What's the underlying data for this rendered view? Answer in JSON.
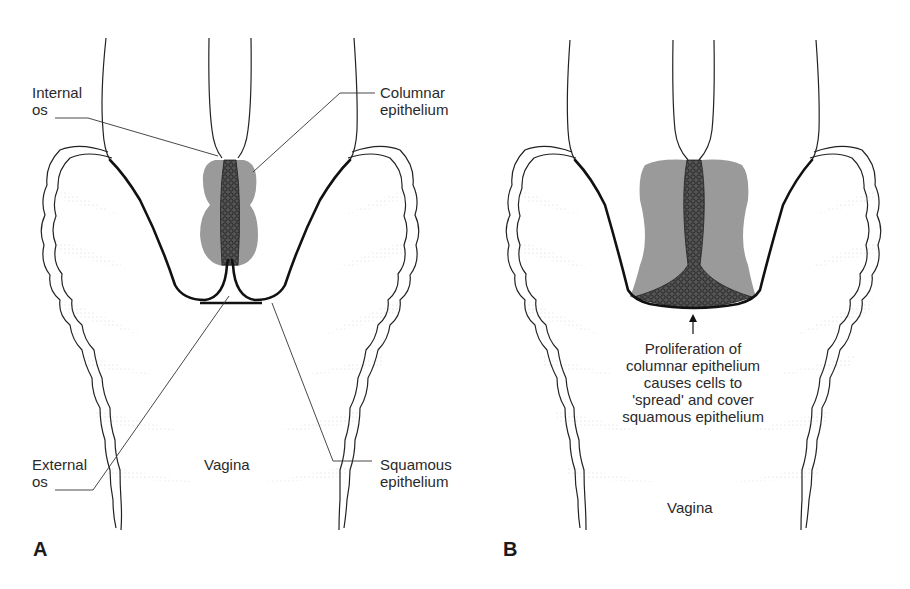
{
  "figure": {
    "panels": [
      {
        "id": "A",
        "letter": "A",
        "labels": {
          "internal_os": [
            "Internal",
            "os"
          ],
          "columnar_epithelium": [
            "Columnar",
            "epithelium"
          ],
          "external_os": [
            "External",
            "os"
          ],
          "squamous_epithelium": [
            "Squamous",
            "epithelium"
          ],
          "vagina": "Vagina"
        }
      },
      {
        "id": "B",
        "letter": "B",
        "caption": [
          "Proliferation of",
          "columnar epithelium",
          "causes cells to",
          "'spread' and cover",
          "squamous epithelium"
        ],
        "labels": {
          "vagina": "Vagina"
        }
      }
    ],
    "colors": {
      "outline": "#1a1a1a",
      "columnar_fill": "#9a9a9a",
      "columnar_cells": "#3a3a3a",
      "rugae_shading": "#d8d8d8"
    }
  }
}
